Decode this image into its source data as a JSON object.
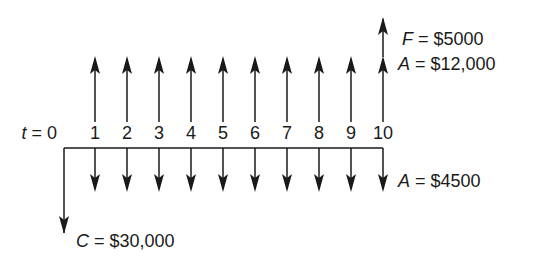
{
  "diagram": {
    "type": "cash-flow-diagram",
    "time_label_prefix": "t = 0",
    "periods": [
      "1",
      "2",
      "3",
      "4",
      "5",
      "6",
      "7",
      "8",
      "9",
      "10"
    ],
    "labels": {
      "future_value": {
        "symbol": "F",
        "text": " = $5000"
      },
      "annual_income": {
        "symbol": "A",
        "text": " = $12,000"
      },
      "annual_cost": {
        "symbol": "A",
        "text": " = $4500"
      },
      "initial_cost": {
        "symbol": "C",
        "text": " = $30,000"
      }
    },
    "flows": {
      "initial_cost_at_t0": 30000,
      "annual_income_t1_to_t10": 12000,
      "annual_cost_t1_to_t10": 4500,
      "future_value_at_t10": 5000
    },
    "colors": {
      "line": "#1a1a1a",
      "background": "#ffffff"
    }
  }
}
